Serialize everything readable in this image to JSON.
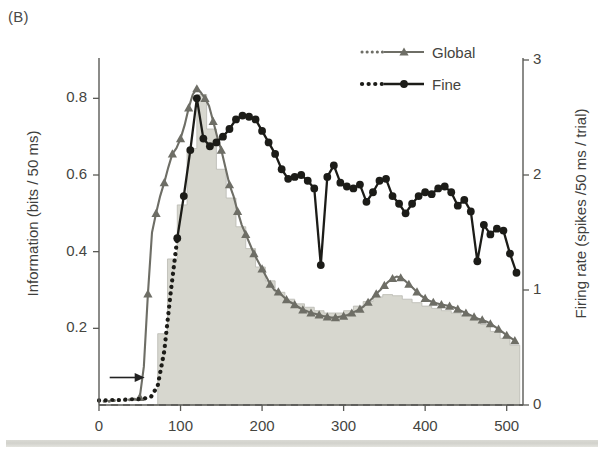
{
  "panel": {
    "label": "(B)"
  },
  "axes": {
    "left_title": "Information (bits / 50 ms)",
    "right_title": "Firing rate (spikes /50 ms / trial)",
    "x_title": "",
    "left_ticks": [
      "0.8",
      "0.6",
      "0.4",
      "0.2"
    ],
    "right_ticks": [
      "3",
      "2",
      "1",
      "0"
    ],
    "x_ticks": [
      "0",
      "100",
      "200",
      "300",
      "400",
      "500"
    ]
  },
  "legend": {
    "position": "top-center",
    "items": [
      {
        "label": "Global",
        "color": "#6e6e66",
        "marker": "triangle"
      },
      {
        "label": "Fine",
        "color": "#1c1c18",
        "marker": "circle"
      }
    ]
  },
  "annotations": [
    {
      "name": "stimulus-onset-arrow",
      "symbol": "arrow-right",
      "x": 45,
      "y": 0.03
    }
  ],
  "colors": {
    "global": "#6e6e66",
    "fine": "#1c1c18",
    "histogram_fill": "#d7d7cf",
    "histogram_edge": "#b9b9b1",
    "axis": "#5a5a56",
    "text": "#3f3f3d",
    "background": "#ffffff",
    "bottom_band": "#d4d4ce"
  },
  "chart_data": {
    "type": "line",
    "title": "",
    "subtitle": "",
    "xlabel": "",
    "ylabel": "Information (bits / 50 ms)",
    "y2label": "Firing rate (spikes /50 ms / trial)",
    "xlim": [
      0,
      520
    ],
    "ylim": [
      0,
      0.9
    ],
    "y2lim": [
      0,
      3
    ],
    "grid": false,
    "legend_position": "top-center",
    "xticks": [
      0,
      100,
      200,
      300,
      400,
      500
    ],
    "yticks": [
      0.2,
      0.4,
      0.6,
      0.8
    ],
    "y2ticks": [
      0,
      1,
      2,
      3
    ],
    "series": [
      {
        "name": "Global",
        "axis": "left",
        "color": "#6e6e66",
        "marker": "triangle",
        "dotted_until_x": 48,
        "x": [
          0,
          5,
          10,
          15,
          20,
          25,
          30,
          35,
          40,
          45,
          50,
          55,
          60,
          65,
          70,
          75,
          80,
          85,
          90,
          95,
          100,
          105,
          110,
          115,
          120,
          125,
          130,
          135,
          140,
          145,
          150,
          155,
          160,
          165,
          170,
          175,
          180,
          185,
          190,
          195,
          200,
          205,
          210,
          215,
          220,
          225,
          230,
          235,
          240,
          245,
          250,
          255,
          260,
          265,
          270,
          275,
          280,
          285,
          290,
          295,
          300,
          305,
          310,
          315,
          320,
          325,
          330,
          335,
          340,
          345,
          350,
          355,
          360,
          365,
          370,
          375,
          380,
          385,
          390,
          395,
          400,
          405,
          410,
          415,
          420,
          425,
          430,
          435,
          440,
          445,
          450,
          455,
          460,
          465,
          470,
          475,
          480,
          485,
          490,
          495,
          500,
          505,
          510
        ],
        "values": [
          0.01,
          0.01,
          0.01,
          0.01,
          0.012,
          0.012,
          0.013,
          0.013,
          0.014,
          0.015,
          0.02,
          0.1,
          0.29,
          0.45,
          0.5,
          0.545,
          0.58,
          0.62,
          0.655,
          0.67,
          0.695,
          0.73,
          0.775,
          0.81,
          0.825,
          0.815,
          0.8,
          0.78,
          0.74,
          0.7,
          0.665,
          0.62,
          0.575,
          0.545,
          0.505,
          0.47,
          0.445,
          0.42,
          0.395,
          0.375,
          0.355,
          0.335,
          0.315,
          0.3,
          0.295,
          0.285,
          0.275,
          0.268,
          0.262,
          0.255,
          0.248,
          0.245,
          0.24,
          0.238,
          0.235,
          0.232,
          0.23,
          0.228,
          0.228,
          0.23,
          0.232,
          0.235,
          0.24,
          0.245,
          0.25,
          0.258,
          0.268,
          0.278,
          0.29,
          0.3,
          0.312,
          0.322,
          0.33,
          0.335,
          0.332,
          0.325,
          0.315,
          0.305,
          0.295,
          0.285,
          0.278,
          0.272,
          0.268,
          0.265,
          0.262,
          0.26,
          0.258,
          0.255,
          0.25,
          0.245,
          0.24,
          0.235,
          0.23,
          0.225,
          0.222,
          0.218,
          0.212,
          0.205,
          0.198,
          0.19,
          0.182,
          0.175,
          0.168
        ]
      },
      {
        "name": "Fine",
        "axis": "left",
        "color": "#1c1c18",
        "marker": "circle",
        "dotted_until_x": 95,
        "x": [
          0,
          8,
          16,
          24,
          32,
          40,
          48,
          56,
          64,
          72,
          80,
          88,
          96,
          104,
          112,
          120,
          128,
          136,
          144,
          152,
          160,
          168,
          176,
          184,
          192,
          200,
          208,
          216,
          224,
          232,
          240,
          248,
          256,
          264,
          272,
          280,
          288,
          296,
          304,
          312,
          320,
          328,
          336,
          344,
          352,
          360,
          368,
          376,
          384,
          392,
          400,
          408,
          416,
          424,
          432,
          440,
          448,
          456,
          464,
          472,
          480,
          488,
          496,
          504,
          512
        ],
        "values": [
          0.012,
          0.012,
          0.013,
          0.013,
          0.014,
          0.015,
          0.015,
          0.017,
          0.022,
          0.05,
          0.14,
          0.295,
          0.435,
          0.545,
          0.665,
          0.8,
          0.695,
          0.675,
          0.685,
          0.7,
          0.72,
          0.745,
          0.755,
          0.752,
          0.745,
          0.715,
          0.685,
          0.655,
          0.615,
          0.59,
          0.595,
          0.6,
          0.585,
          0.565,
          0.365,
          0.595,
          0.625,
          0.58,
          0.57,
          0.565,
          0.575,
          0.53,
          0.555,
          0.585,
          0.59,
          0.545,
          0.525,
          0.5,
          0.525,
          0.545,
          0.555,
          0.55,
          0.565,
          0.57,
          0.555,
          0.52,
          0.535,
          0.505,
          0.375,
          0.47,
          0.445,
          0.46,
          0.455,
          0.395,
          0.345
        ]
      }
    ],
    "histogram": {
      "name": "Firing rate PSTH",
      "axis": "right",
      "type": "bar",
      "fill": "#d7d7cf",
      "bin_width": 12,
      "bin_starts": [
        60,
        72,
        84,
        96,
        108,
        120,
        132,
        144,
        156,
        168,
        180,
        192,
        204,
        216,
        228,
        240,
        252,
        264,
        276,
        288,
        300,
        312,
        324,
        336,
        348,
        360,
        372,
        384,
        396,
        408,
        420,
        432,
        444,
        456,
        468,
        480,
        492,
        504
      ],
      "values": [
        0.0,
        0.62,
        1.27,
        1.74,
        2.23,
        2.7,
        2.4,
        2.05,
        1.8,
        1.55,
        1.36,
        1.2,
        1.08,
        0.98,
        0.92,
        0.88,
        0.85,
        0.82,
        0.8,
        0.8,
        0.82,
        0.86,
        0.9,
        0.94,
        0.96,
        0.95,
        0.92,
        0.89,
        0.86,
        0.84,
        0.82,
        0.8,
        0.78,
        0.74,
        0.7,
        0.64,
        0.58,
        0.52
      ]
    }
  }
}
